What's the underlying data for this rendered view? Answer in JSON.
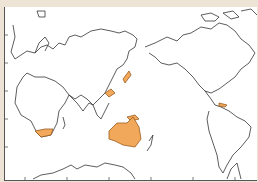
{
  "map": {
    "type": "world-outline-map",
    "projection": "Pacific-centered equirectangular",
    "colors": {
      "background": "#ede4d6",
      "ocean": "#ffffff",
      "outline": "#333333",
      "highlight": "#f2a85a",
      "highlight_stroke": "#9a5c20"
    },
    "highlighted_regions": [
      "South Africa",
      "Japan",
      "Southern China coast",
      "Indonesia / New Guinea",
      "Australia",
      "Caribbean"
    ]
  }
}
